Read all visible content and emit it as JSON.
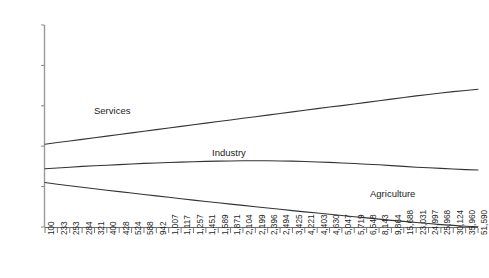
{
  "chart_data": {
    "type": "line",
    "title": "",
    "xlabel": "",
    "ylabel": "",
    "ylim": [
      0,
      100
    ],
    "ytick_labels": [
      "0%",
      "20%",
      "40%",
      "60%",
      "80%",
      "100%"
    ],
    "ytick_values": [
      0,
      20,
      40,
      60,
      80,
      100
    ],
    "grid": false,
    "legend_position": "inline-labels",
    "categories": [
      "100",
      "233",
      "253",
      "284",
      "321",
      "400",
      "428",
      "524",
      "588",
      "942",
      "1,007",
      "1,117",
      "1,257",
      "1,451",
      "1,589",
      "1,871",
      "2,104",
      "2,199",
      "2,396",
      "2,494",
      "3,425",
      "4,221",
      "4,403",
      "4,630",
      "5,047",
      "5,719",
      "6,548",
      "8,143",
      "9,864",
      "15,688",
      "23,031",
      "24,997",
      "25,968",
      "30,124",
      "35,960",
      "51,590"
    ],
    "series": [
      {
        "name": "Services",
        "color": "#333333",
        "values": [
          41.0,
          41.8,
          42.6,
          43.4,
          44.2,
          45.0,
          45.8,
          46.6,
          47.4,
          48.2,
          49.0,
          49.8,
          50.6,
          51.4,
          52.2,
          53.0,
          53.8,
          54.6,
          55.4,
          56.2,
          57.0,
          57.8,
          58.6,
          59.4,
          60.1,
          60.9,
          61.7,
          62.5,
          63.3,
          64.1,
          64.9,
          65.6,
          66.3,
          67.0,
          67.6,
          68.2
        ]
      },
      {
        "name": "Industry",
        "color": "#333333",
        "values": [
          28.8,
          29.2,
          29.6,
          30.0,
          30.3,
          30.6,
          30.9,
          31.2,
          31.5,
          31.7,
          31.9,
          32.1,
          32.3,
          32.5,
          32.6,
          32.7,
          32.8,
          32.8,
          32.8,
          32.7,
          32.6,
          32.4,
          32.2,
          32.0,
          31.7,
          31.4,
          31.1,
          30.8,
          30.4,
          30.0,
          29.6,
          29.3,
          29.0,
          28.7,
          28.4,
          28.2
        ]
      },
      {
        "name": "Agriculture",
        "color": "#333333",
        "values": [
          22.0,
          21.2,
          20.4,
          19.7,
          18.9,
          18.2,
          17.5,
          16.8,
          16.1,
          15.4,
          14.7,
          14.0,
          13.3,
          12.6,
          12.0,
          11.3,
          10.7,
          10.0,
          9.4,
          8.8,
          8.1,
          7.5,
          6.9,
          6.3,
          5.7,
          5.1,
          4.5,
          3.9,
          3.3,
          2.8,
          2.2,
          1.7,
          1.2,
          0.8,
          0.4,
          0.1
        ]
      }
    ],
    "series_label_positions": [
      {
        "name": "Services",
        "left": 94,
        "top": 105
      },
      {
        "name": "Industry",
        "left": 212,
        "top": 147
      },
      {
        "name": "Agriculture",
        "left": 370,
        "top": 188
      }
    ]
  }
}
